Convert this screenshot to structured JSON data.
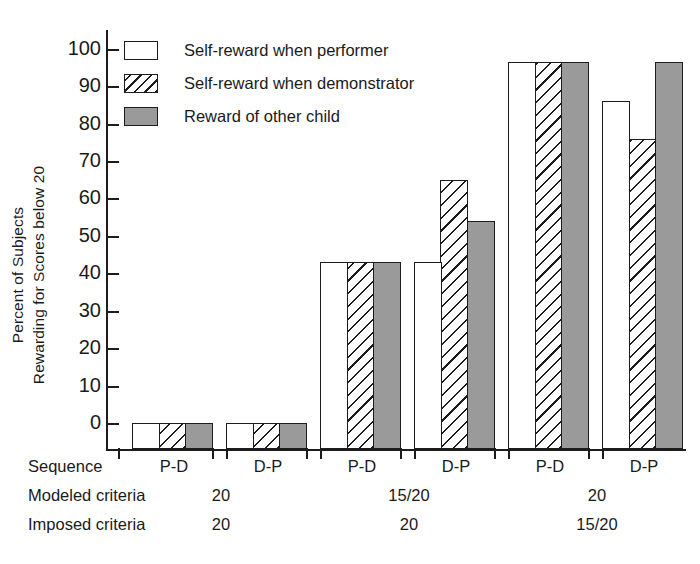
{
  "chart_data": {
    "type": "bar",
    "title": "",
    "xlabel": "",
    "ylabel_line1": "Percent of Subjects",
    "ylabel_line2": "Rewarding for Scores below 20",
    "ylim": [
      0,
      105
    ],
    "yticks": [
      0,
      10,
      20,
      30,
      40,
      50,
      60,
      70,
      80,
      90,
      100
    ],
    "ytick_labels": [
      "0",
      "10",
      "20",
      "30",
      "40",
      "50",
      "60",
      "70",
      "80",
      "90",
      "100"
    ],
    "grid": false,
    "legend_position": "upper-left-inside",
    "categories": [
      "P-D",
      "D-P",
      "P-D",
      "D-P",
      "P-D",
      "D-P"
    ],
    "series": [
      {
        "name": "Self-reward when performer",
        "fill": "white",
        "values": [
          0,
          0,
          43,
          43,
          96.5,
          86
        ]
      },
      {
        "name": "Self-reward when demonstrator",
        "fill": "hatch",
        "values": [
          0,
          0,
          43,
          65,
          96.5,
          76
        ]
      },
      {
        "name": "Reward of other child",
        "fill": "gray",
        "values": [
          0,
          0,
          43,
          54,
          96.5,
          96.5
        ]
      }
    ],
    "group_annotations": {
      "row_labels": [
        "Sequence",
        "Modeled criteria",
        "Imposed criteria"
      ],
      "sequence": [
        "P-D",
        "D-P",
        "P-D",
        "D-P",
        "P-D",
        "D-P"
      ],
      "modeled_criteria": [
        "20",
        "15/20",
        "20"
      ],
      "imposed_criteria": [
        "20",
        "20",
        "15/20"
      ],
      "modeled_criteria_spans": [
        [
          0,
          1
        ],
        [
          2,
          3
        ],
        [
          4,
          5
        ]
      ],
      "imposed_criteria_spans": [
        [
          0,
          1
        ],
        [
          2,
          3
        ],
        [
          4,
          5
        ]
      ]
    },
    "colors": {
      "ink": "#1c1c1c",
      "gray_fill": "#9a9a9a",
      "white_fill": "#ffffff",
      "background": "#ffffff"
    }
  },
  "legend": {
    "items": [
      {
        "label": "Self-reward when performer",
        "fill": "white"
      },
      {
        "label": "Self-reward when demonstrator",
        "fill": "hatch"
      },
      {
        "label": "Reward of other child",
        "fill": "gray"
      }
    ]
  },
  "yaxis": {
    "label_line1": "Percent of Subjects",
    "label_line2": "Rewarding for Scores below 20",
    "ticks": [
      "100",
      "90",
      "80",
      "70",
      "60",
      "50",
      "40",
      "30",
      "20",
      "10",
      "0"
    ]
  },
  "bottom_table": {
    "rows": [
      {
        "name": "Sequence",
        "cells": [
          "P-D",
          "D-P",
          "P-D",
          "D-P",
          "P-D",
          "D-P"
        ]
      },
      {
        "name": "Modeled criteria",
        "cells": [
          "20",
          "15/20",
          "20"
        ]
      },
      {
        "name": "Imposed criteria",
        "cells": [
          "20",
          "20",
          "15/20"
        ]
      }
    ]
  }
}
